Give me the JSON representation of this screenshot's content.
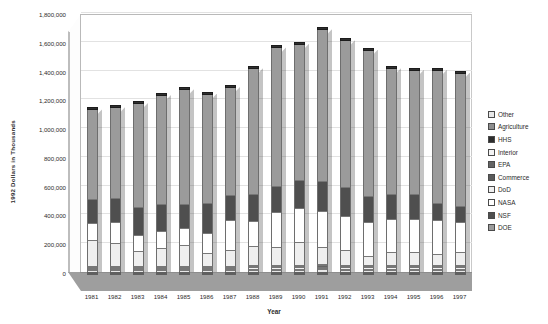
{
  "chart_data": {
    "type": "bar",
    "stacked": true,
    "title": "",
    "xlabel": "Year",
    "ylabel": "1992 Dollars in Thousands",
    "ylim": [
      0,
      1800000
    ],
    "ytick_step": 200000,
    "grid": true,
    "legend_position": "right",
    "style": "3d-stacked-column",
    "categories": [
      "1981",
      "1982",
      "1983",
      "1984",
      "1985",
      "1986",
      "1987",
      "1988",
      "1989",
      "1990",
      "1991",
      "1992",
      "1993",
      "1994",
      "1995",
      "1996",
      "1997"
    ],
    "ytick_labels": [
      "0",
      "200,000",
      "400,000",
      "600,000",
      "800,000",
      "1,000,000",
      "1,200,000",
      "1,400,000",
      "1,600,000",
      "1,800,000"
    ],
    "series": [
      {
        "name": "DOE",
        "color": "#9b9b9b",
        "values": [
          620000,
          630000,
          720000,
          755000,
          800000,
          760000,
          750000,
          875000,
          960000,
          945000,
          1055000,
          1020000,
          1020000,
          875000,
          865000,
          925000,
          925000
        ]
      },
      {
        "name": "NSF",
        "color": "#4f4f4f",
        "values": [
          170000,
          170000,
          195000,
          190000,
          165000,
          210000,
          175000,
          185000,
          185000,
          195000,
          210000,
          200000,
          180000,
          175000,
          175000,
          120000,
          115000
        ]
      },
      {
        "name": "NASA",
        "color": "#ffffff",
        "values": [
          120000,
          140000,
          115000,
          115000,
          115000,
          135000,
          205000,
          175000,
          245000,
          240000,
          245000,
          240000,
          235000,
          225000,
          225000,
          235000,
          210000
        ]
      },
      {
        "name": "DoD",
        "color": "#efefef",
        "values": [
          175000,
          160000,
          100000,
          125000,
          145000,
          90000,
          110000,
          130000,
          120000,
          155000,
          120000,
          100000,
          60000,
          90000,
          90000,
          75000,
          85000
        ]
      },
      {
        "name": "Commerce",
        "color": "#5a5a5a",
        "values": [
          8000,
          8000,
          8000,
          8000,
          8000,
          8000,
          8000,
          9000,
          9000,
          9000,
          10000,
          9000,
          9000,
          9000,
          9000,
          9000,
          9000
        ]
      },
      {
        "name": "EPA",
        "color": "#646464",
        "values": [
          8000,
          8000,
          8000,
          8000,
          8000,
          8000,
          8000,
          9000,
          9000,
          9000,
          10000,
          9000,
          9000,
          9000,
          9000,
          9000,
          9000
        ]
      },
      {
        "name": "Interior",
        "color": "#f4f4f4",
        "values": [
          8000,
          8000,
          8000,
          8000,
          8000,
          8000,
          8000,
          9000,
          9000,
          9000,
          10000,
          9000,
          9000,
          9000,
          9000,
          9000,
          9000
        ]
      },
      {
        "name": "HHS",
        "color": "#2d2d2d",
        "values": [
          6000,
          6000,
          6000,
          6000,
          6000,
          6000,
          6000,
          7000,
          7000,
          7000,
          8000,
          7000,
          7000,
          7000,
          7000,
          7000,
          7000
        ]
      },
      {
        "name": "Agriculture",
        "color": "#8e8e8e",
        "values": [
          6000,
          6000,
          6000,
          6000,
          6000,
          6000,
          6000,
          7000,
          7000,
          7000,
          8000,
          7000,
          7000,
          7000,
          7000,
          7000,
          7000
        ]
      },
      {
        "name": "Other",
        "color": "#e8e8e8",
        "values": [
          9000,
          9000,
          9000,
          9000,
          9000,
          9000,
          9000,
          10000,
          10000,
          10000,
          11000,
          10000,
          10000,
          10000,
          10000,
          10000,
          10000
        ]
      }
    ],
    "totals": [
      1130000,
      1145000,
      1175000,
      1230000,
      1270000,
      1240000,
      1295000,
      1416000,
      1561000,
      1596000,
      1697000,
      1611000,
      1546000,
      1416000,
      1406000,
      1406000,
      1387000
    ],
    "legend_order_top_to_bottom": [
      "Other",
      "Agriculture",
      "HHS",
      "Interior",
      "EPA",
      "Commerce",
      "DoD",
      "NASA",
      "NSF",
      "DOE"
    ]
  },
  "colors": {
    "background": "#ffffff",
    "plot_background": "#ffffff",
    "floor": "#9e9e9e",
    "gridline": "#e2e2e2",
    "axis": "#b9b9b9",
    "text": "#2b2b2b",
    "bar_outline": "#6e6e6e",
    "bar_cap": "#2e2e2e"
  }
}
